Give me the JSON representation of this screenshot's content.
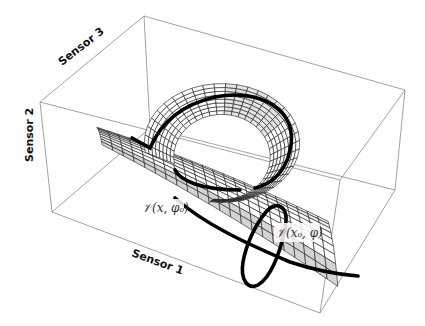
{
  "figure": {
    "axes": {
      "x_label": "Sensor 1",
      "y_label": "Sensor 2",
      "z_label": "Sensor 3"
    },
    "annotations": [
      {
        "id": "curve-x",
        "text": "𝒱(x, φₒ)"
      },
      {
        "id": "curve-phi",
        "text": "𝒱(xₒ, φ)"
      }
    ],
    "surface": {
      "description": "mesh surface in 3D sensor space",
      "shading_colors": [
        "#ffffff",
        "#e2e2e2",
        "#c8c8c8"
      ],
      "mesh_color": "#1a1a1a",
      "highlight_curve_color": "#000000"
    },
    "box_color": "#8a8a8a"
  }
}
